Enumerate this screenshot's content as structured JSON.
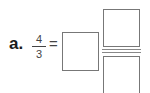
{
  "problem": {
    "label": "a.",
    "fraction": {
      "numerator": "4",
      "denominator": "3"
    },
    "equals": "=",
    "answer_boxes": [
      "whole-number",
      "numerator",
      "denominator"
    ]
  }
}
